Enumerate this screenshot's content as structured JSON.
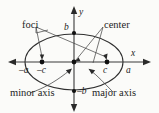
{
  "figure": {
    "kind": "ellipse-anatomy-diagram",
    "background_color": "#fbfbf9",
    "ink_color": "#1d1d1d",
    "axes": {
      "x_label": "x",
      "y_label": "y",
      "origin": {
        "x": 74,
        "y": 62
      }
    },
    "callouts": {
      "foci": "foci",
      "center": "center",
      "minor_axis": "minor axis",
      "major_axis": "major axis"
    },
    "tick_labels": {
      "neg_a": "–a",
      "neg_c": "–c",
      "pos_c": "c",
      "pos_a": "a",
      "pos_b": "b",
      "neg_b": "–b"
    },
    "points": {
      "left_focus": {
        "x": 42,
        "y": 62,
        "label": "–c"
      },
      "center": {
        "x": 74,
        "y": 62,
        "label": "center"
      },
      "right_focus": {
        "x": 107,
        "y": 62,
        "label": "c"
      },
      "top_vertex": {
        "x": 74,
        "y": 31,
        "label": "b"
      },
      "bottom_vertex": {
        "x": 74,
        "y": 93,
        "label": "–b"
      }
    },
    "ellipse": {
      "cx": 74,
      "cy": 62,
      "rx": 49,
      "ry": 28
    }
  }
}
